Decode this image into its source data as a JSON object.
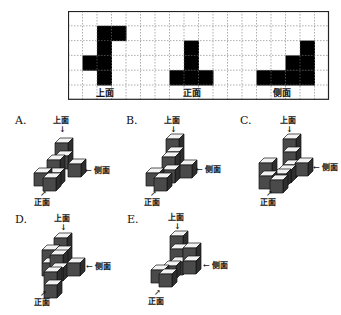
{
  "views": {
    "grid": {
      "cols": 18,
      "rows": 6,
      "cell_w": 14.5,
      "cell_h": 14.8
    },
    "top_view": {
      "label": "上面",
      "cells": [
        [
          1,
          2
        ],
        [
          1,
          3
        ],
        [
          2,
          2
        ],
        [
          3,
          1
        ],
        [
          3,
          2
        ],
        [
          4,
          2
        ]
      ]
    },
    "front_view": {
      "label": "正面",
      "cells": [
        [
          2,
          8
        ],
        [
          3,
          8
        ],
        [
          4,
          7
        ],
        [
          4,
          8
        ],
        [
          4,
          9
        ]
      ]
    },
    "side_view": {
      "label": "侧面",
      "cells": [
        [
          2,
          16
        ],
        [
          3,
          15
        ],
        [
          3,
          16
        ],
        [
          4,
          13
        ],
        [
          4,
          14
        ],
        [
          4,
          15
        ],
        [
          4,
          16
        ]
      ]
    }
  },
  "direction_labels": {
    "top": "上面",
    "front": "正面",
    "side": "侧面"
  },
  "options": [
    {
      "label": "A.",
      "cubes": [
        [
          55,
          143
        ],
        [
          55,
          156
        ],
        [
          68,
          164
        ],
        [
          47,
          160
        ],
        [
          47,
          173
        ],
        [
          34,
          173
        ],
        [
          43,
          178
        ]
      ]
    },
    {
      "label": "B.",
      "cubes": [
        [
          166,
          139
        ],
        [
          166,
          152
        ],
        [
          179,
          165
        ],
        [
          162,
          157
        ],
        [
          162,
          170
        ],
        [
          146,
          173
        ],
        [
          154,
          178
        ]
      ]
    },
    {
      "label": "C.",
      "cubes": [
        [
          283,
          139
        ],
        [
          283,
          152
        ],
        [
          283,
          165
        ],
        [
          295,
          163
        ],
        [
          278,
          170
        ],
        [
          273,
          174
        ],
        [
          259,
          163
        ],
        [
          259,
          176
        ],
        [
          270,
          180
        ]
      ]
    },
    {
      "label": "D.",
      "cubes": [
        [
          54,
          238
        ],
        [
          42,
          250
        ],
        [
          42,
          263
        ],
        [
          54,
          251
        ],
        [
          50,
          255
        ],
        [
          50,
          268
        ],
        [
          67,
          263
        ],
        [
          44,
          272
        ],
        [
          44,
          285
        ]
      ]
    },
    {
      "label": "E.",
      "cubes": [
        [
          170,
          236
        ],
        [
          170,
          249
        ],
        [
          170,
          262
        ],
        [
          183,
          248
        ],
        [
          183,
          261
        ],
        [
          163,
          266
        ],
        [
          151,
          270
        ],
        [
          159,
          274
        ]
      ]
    }
  ],
  "colors": {
    "cube_front": "#4a4a4a",
    "cube_top": "#f2f2f2",
    "cube_side": "#2e2e2e",
    "fill": "#000000"
  }
}
